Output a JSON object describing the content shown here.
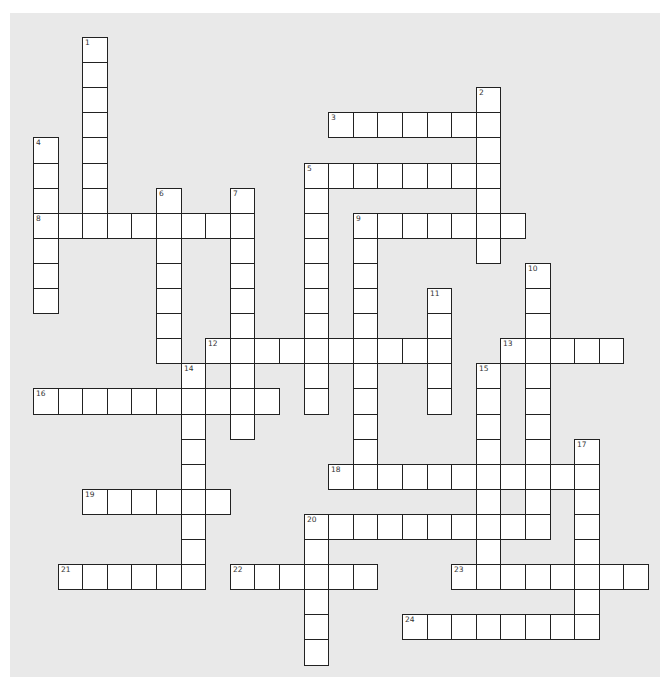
{
  "puzzle": {
    "type": "crossword",
    "geometry": {
      "origin_x": 33,
      "origin_y": 37,
      "cell_w": 24.6,
      "cell_h": 25.1
    },
    "colors": {
      "background": "#e9e9e9",
      "cell": "#ffffff",
      "border": "#222222"
    },
    "across": [
      {
        "number": "3",
        "col": 12,
        "row": 3,
        "length": 7
      },
      {
        "number": "5",
        "col": 11,
        "row": 5,
        "length": 8
      },
      {
        "number": "8",
        "col": 0,
        "row": 7,
        "length": 9
      },
      {
        "number": "9",
        "col": 13,
        "row": 7,
        "length": 7
      },
      {
        "number": "12",
        "col": 7,
        "row": 12,
        "length": 10
      },
      {
        "number": "13",
        "col": 19,
        "row": 12,
        "length": 5
      },
      {
        "number": "16",
        "col": 0,
        "row": 14,
        "length": 10
      },
      {
        "number": "18",
        "col": 12,
        "row": 17,
        "length": 11
      },
      {
        "number": "19",
        "col": 2,
        "row": 18,
        "length": 6
      },
      {
        "number": "20",
        "col": 11,
        "row": 19,
        "length": 10
      },
      {
        "number": "21",
        "col": 1,
        "row": 21,
        "length": 6
      },
      {
        "number": "22",
        "col": 8,
        "row": 21,
        "length": 6
      },
      {
        "number": "23",
        "col": 17,
        "row": 21,
        "length": 8
      },
      {
        "number": "24",
        "col": 15,
        "row": 23,
        "length": 8
      }
    ],
    "down": [
      {
        "number": "1",
        "col": 2,
        "row": 0,
        "length": 8
      },
      {
        "number": "2",
        "col": 18,
        "row": 2,
        "length": 7
      },
      {
        "number": "4",
        "col": 0,
        "row": 4,
        "length": 7
      },
      {
        "number": "5",
        "col": 11,
        "row": 5,
        "length": 10
      },
      {
        "number": "6",
        "col": 5,
        "row": 6,
        "length": 7
      },
      {
        "number": "7",
        "col": 8,
        "row": 6,
        "length": 10
      },
      {
        "number": "9",
        "col": 13,
        "row": 7,
        "length": 11
      },
      {
        "number": "10",
        "col": 20,
        "row": 9,
        "length": 11
      },
      {
        "number": "11",
        "col": 16,
        "row": 10,
        "length": 5
      },
      {
        "number": "14",
        "col": 6,
        "row": 13,
        "length": 9
      },
      {
        "number": "15",
        "col": 18,
        "row": 13,
        "length": 9
      },
      {
        "number": "17",
        "col": 22,
        "row": 16,
        "length": 8
      },
      {
        "number": "20",
        "col": 11,
        "row": 19,
        "length": 6
      }
    ]
  }
}
